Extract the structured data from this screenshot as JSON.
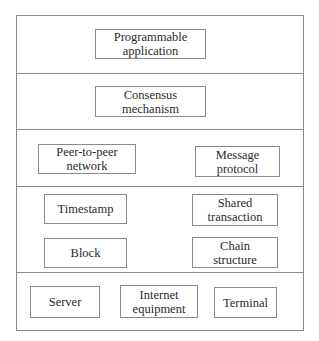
{
  "diagram": {
    "title": "",
    "layers": [
      {
        "name": "application-layer",
        "nodes": [
          {
            "label": "Programmable\napplication"
          }
        ]
      },
      {
        "name": "consensus-layer",
        "nodes": [
          {
            "label": "Consensus\nmechanism"
          }
        ]
      },
      {
        "name": "network-layer",
        "nodes": [
          {
            "label": "Peer-to-peer\nnetwork"
          },
          {
            "label": "Message\nprotocol"
          }
        ]
      },
      {
        "name": "data-layer",
        "nodes": [
          {
            "label": "Timestamp"
          },
          {
            "label": "Shared\ntransaction"
          },
          {
            "label": "Block"
          },
          {
            "label": "Chain\nstructure"
          }
        ]
      },
      {
        "name": "physical-layer",
        "nodes": [
          {
            "label": "Server"
          },
          {
            "label": "Internet\nequipment"
          },
          {
            "label": "Terminal"
          }
        ]
      }
    ]
  }
}
